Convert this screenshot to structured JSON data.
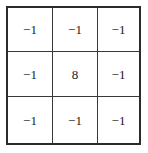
{
  "figure": {
    "name": "laplacian-kernel-matrix",
    "rows": 3,
    "columns": 3,
    "colors": {
      "background": "#ffffff",
      "outer_border": "#2b2b2b",
      "grid_line": "#3a3a3a",
      "text": "#1a1a1a"
    }
  },
  "chart_data": {
    "type": "table",
    "title": "",
    "xlabel": "",
    "ylabel": "",
    "rows": 3,
    "columns": 3,
    "values": [
      [
        "−1",
        "−1",
        "−1"
      ],
      [
        "−1",
        "8",
        "−1"
      ],
      [
        "−1",
        "−1",
        "−1"
      ]
    ],
    "numeric_values": [
      [
        -1,
        -1,
        -1
      ],
      [
        -1,
        8,
        -1
      ],
      [
        -1,
        -1,
        -1
      ]
    ],
    "grid": true,
    "legend": "none"
  },
  "cells": [
    {
      "id": "r0c0",
      "value": "−1"
    },
    {
      "id": "r0c1",
      "value": "−1"
    },
    {
      "id": "r0c2",
      "value": "−1"
    },
    {
      "id": "r1c0",
      "value": "−1"
    },
    {
      "id": "r1c1",
      "value": "8"
    },
    {
      "id": "r1c2",
      "value": "−1"
    },
    {
      "id": "r2c0",
      "value": "−1"
    },
    {
      "id": "r2c1",
      "value": "−1"
    },
    {
      "id": "r2c2",
      "value": "−1"
    }
  ]
}
